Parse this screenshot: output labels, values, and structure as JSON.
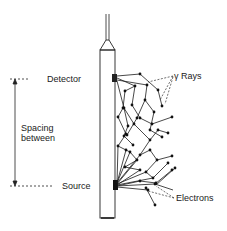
{
  "diagram": {
    "labels": {
      "detector": "Detector",
      "source": "Source",
      "spacing_line1": "Spacing",
      "spacing_line2": "between",
      "gamma_rays": "γ Rays",
      "electrons": "Electrons"
    },
    "colors": {
      "ink": "#1a1a1a",
      "background": "#ffffff"
    }
  }
}
